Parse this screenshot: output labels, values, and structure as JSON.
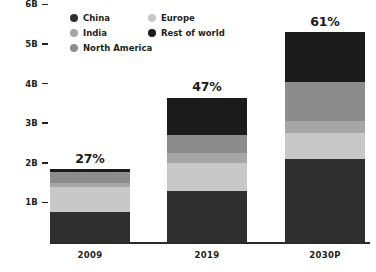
{
  "chart_data": {
    "type": "bar",
    "subtype": "stacked-bar",
    "title": "",
    "xlabel": "",
    "ylabel": "",
    "categories": [
      "2009",
      "2019",
      "2030P"
    ],
    "x_tick_labels": [
      "2009",
      "2019",
      "2030P"
    ],
    "y_tick_labels": [
      "1B",
      "2B",
      "3B",
      "4B",
      "5B",
      "6B"
    ],
    "y_tick_values": [
      1,
      2,
      3,
      4,
      5,
      6
    ],
    "ylim": [
      0,
      6
    ],
    "grid": false,
    "legend_position": "top-center",
    "series": [
      {
        "name": "China",
        "color": "#2f2f2f",
        "values": [
          0.75,
          1.3,
          2.1
        ]
      },
      {
        "name": "Europe",
        "color": "#c8c8c8",
        "values": [
          0.65,
          0.7,
          0.65
        ]
      },
      {
        "name": "India",
        "color": "#a6a6a6",
        "values": [
          0.08,
          0.25,
          0.3
        ]
      },
      {
        "name": "North America",
        "color": "#8c8c8c",
        "values": [
          0.28,
          0.45,
          1.0
        ]
      },
      {
        "name": "Rest of world",
        "color": "#1b1b1b",
        "values": [
          0.09,
          0.95,
          1.25
        ]
      }
    ],
    "stack_order_bottom_to_top": [
      "China",
      "Europe",
      "India",
      "North America",
      "Rest of world"
    ],
    "totals": [
      1.85,
      3.65,
      5.3
    ],
    "annotations": [
      {
        "category": "2009",
        "text": "27%",
        "position": "above-bar"
      },
      {
        "category": "2019",
        "text": "47%",
        "position": "above-bar"
      },
      {
        "category": "2030P",
        "text": "61%",
        "position": "above-bar"
      }
    ]
  },
  "legend": {
    "columns": [
      {
        "items": [
          {
            "label": "China",
            "color": "#2f2f2f"
          },
          {
            "label": "India",
            "color": "#a6a6a6"
          },
          {
            "label": "North America",
            "color": "#8c8c8c"
          }
        ]
      },
      {
        "items": [
          {
            "label": "Europe",
            "color": "#c8c8c8"
          },
          {
            "label": "Rest of world",
            "color": "#1b1b1b"
          }
        ]
      }
    ]
  },
  "axis": {
    "y_ticks": [
      {
        "label": "6B",
        "value": 6
      },
      {
        "label": "5B",
        "value": 5
      },
      {
        "label": "4B",
        "value": 4
      },
      {
        "label": "3B",
        "value": 3
      },
      {
        "label": "2B",
        "value": 2
      },
      {
        "label": "1B",
        "value": 1
      }
    ]
  },
  "colors": {
    "china": "#2f2f2f",
    "europe": "#c8c8c8",
    "india": "#a6a6a6",
    "north_america": "#8c8c8c",
    "rest_of_world": "#1b1b1b",
    "axis": "#231f20",
    "background": "#ffffff",
    "label_text": "#1a1a1a"
  }
}
